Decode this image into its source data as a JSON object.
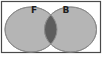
{
  "diagram": {
    "type": "venn-two-set",
    "left_set_label": "F",
    "right_set_label": "B",
    "intersection_shaded": true,
    "colors": {
      "background": "#ffffff",
      "frame_fill": "#ffffff",
      "frame_stroke": "#4a4a4a",
      "set_fill": "#b5b5b5",
      "set_stroke": "#8c8c8c",
      "intersection_fill": "#5d5d5d",
      "label_color": "#1f1f1f"
    }
  }
}
